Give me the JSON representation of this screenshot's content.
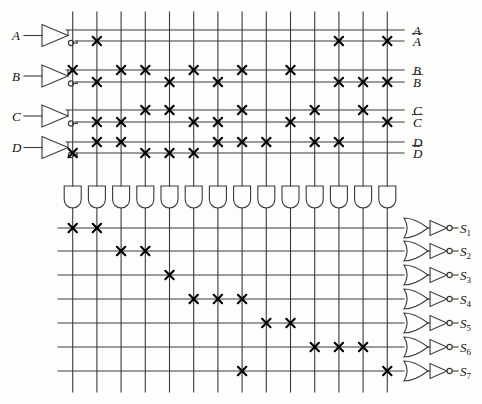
{
  "diagram": {
    "type": "pla-logic-diagram",
    "colors": {
      "line": "#3a3a3a",
      "background": "#fdfdfb",
      "text": "#111111",
      "cross": "#000000"
    },
    "geometry": {
      "columns_x": [
        72.7,
        96.9,
        121.1,
        145.3,
        169.5,
        193.7,
        217.9,
        242.1,
        266.3,
        290.5,
        314.7,
        338.9,
        363.1,
        387.3
      ],
      "column_count": 14,
      "input_rows_y": [
        30,
        41,
        70,
        82,
        110,
        122,
        142,
        153
      ],
      "output_rows_y": [
        228,
        251,
        275,
        299,
        323,
        347,
        371
      ],
      "matrix_left": 60,
      "matrix_right": 404,
      "and_gate_y": 186,
      "and_gate_w": 17,
      "and_gate_h": 22
    }
  },
  "inputs": [
    {
      "name": "input-a",
      "label": "A",
      "y": 36
    },
    {
      "name": "input-b",
      "label": "B",
      "y": 76
    },
    {
      "name": "input-c",
      "label": "C",
      "y": 116
    },
    {
      "name": "input-d",
      "label": "D",
      "y": 147
    }
  ],
  "input_lines": [
    {
      "name": "line-a",
      "label": "A",
      "overbar": false,
      "y": 30,
      "row": 0
    },
    {
      "name": "line-a-bar",
      "label": "A",
      "overbar": true,
      "y": 41,
      "row": 1
    },
    {
      "name": "line-b",
      "label": "B",
      "overbar": false,
      "y": 70,
      "row": 2
    },
    {
      "name": "line-b-bar",
      "label": "B",
      "overbar": true,
      "y": 82,
      "row": 3
    },
    {
      "name": "line-c",
      "label": "C",
      "overbar": false,
      "y": 110,
      "row": 4
    },
    {
      "name": "line-c-bar",
      "label": "C",
      "overbar": true,
      "y": 122,
      "row": 5
    },
    {
      "name": "line-d",
      "label": "D",
      "overbar": false,
      "y": 142,
      "row": 6
    },
    {
      "name": "line-d-bar",
      "label": "D",
      "overbar": true,
      "y": 153,
      "row": 7
    }
  ],
  "outputs": [
    {
      "name": "output-s1",
      "label": "S",
      "sub": "1",
      "y": 228
    },
    {
      "name": "output-s2",
      "label": "S",
      "sub": "2",
      "y": 251
    },
    {
      "name": "output-s3",
      "label": "S",
      "sub": "3",
      "y": 275
    },
    {
      "name": "output-s4",
      "label": "S",
      "sub": "4",
      "y": 299
    },
    {
      "name": "output-s5",
      "label": "S",
      "sub": "5",
      "y": 323
    },
    {
      "name": "output-s6",
      "label": "S",
      "sub": "6",
      "y": 347
    },
    {
      "name": "output-s7",
      "label": "S",
      "sub": "7",
      "y": 371
    }
  ],
  "and_plane_connections": [
    {
      "row": 0,
      "line": "A",
      "columns": []
    },
    {
      "row": 1,
      "line": "Abar",
      "columns": [
        2,
        12,
        14
      ]
    },
    {
      "row": 2,
      "line": "B",
      "columns": [
        1,
        3,
        4,
        6,
        8,
        10
      ]
    },
    {
      "row": 3,
      "line": "Bbar",
      "columns": [
        2,
        5,
        7,
        12,
        13,
        14
      ]
    },
    {
      "row": 4,
      "line": "C",
      "columns": [
        4,
        5,
        8,
        11,
        13
      ]
    },
    {
      "row": 5,
      "line": "Cbar",
      "columns": [
        2,
        3,
        6,
        7,
        10,
        14
      ]
    },
    {
      "row": 6,
      "line": "D",
      "columns": [
        2,
        3,
        7,
        8,
        9,
        11,
        12
      ]
    },
    {
      "row": 7,
      "line": "Dbar",
      "columns": [
        1,
        4,
        5,
        6
      ]
    }
  ],
  "or_plane_connections": [
    {
      "row": 0,
      "output": "S1",
      "columns": [
        1,
        2
      ]
    },
    {
      "row": 1,
      "output": "S2",
      "columns": [
        3,
        4
      ]
    },
    {
      "row": 2,
      "output": "S3",
      "columns": [
        5
      ]
    },
    {
      "row": 3,
      "output": "S4",
      "columns": [
        6,
        7,
        8
      ]
    },
    {
      "row": 4,
      "output": "S5",
      "columns": [
        9,
        10
      ]
    },
    {
      "row": 5,
      "output": "S6",
      "columns": [
        11,
        12,
        13
      ]
    },
    {
      "row": 6,
      "output": "S7",
      "columns": [
        8,
        14
      ]
    }
  ]
}
